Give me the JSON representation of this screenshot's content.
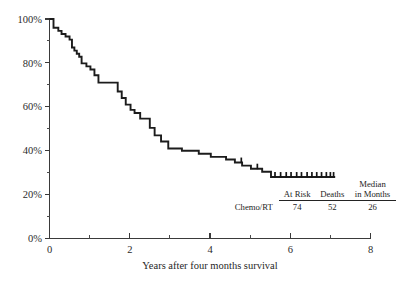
{
  "chart_data": {
    "type": "line",
    "subtype": "kaplan-meier-step",
    "title": "",
    "xlabel": "Years after four months survival",
    "ylabel": "",
    "xlim": [
      0,
      8
    ],
    "ylim": [
      0,
      100
    ],
    "grid": false,
    "legend_position": "inside-bottom-right-table",
    "x_ticks_major": [
      0,
      2,
      4,
      6,
      8
    ],
    "x_ticks_major_labels": [
      "0",
      "2",
      "4",
      "6",
      "8"
    ],
    "x_ticks_minor": [
      1,
      3,
      5,
      7
    ],
    "y_ticks_major": [
      0,
      20,
      40,
      60,
      80,
      100
    ],
    "y_ticks_major_labels": [
      "0%",
      "20%",
      "40%",
      "60%",
      "80%",
      "100%"
    ],
    "y_ticks_minor": [
      10,
      30,
      50,
      70,
      90
    ],
    "series": [
      {
        "name": "Chemo/RT",
        "x": [
          0.0,
          0.1,
          0.1,
          0.22,
          0.22,
          0.3,
          0.3,
          0.4,
          0.4,
          0.5,
          0.5,
          0.56,
          0.56,
          0.62,
          0.62,
          0.68,
          0.68,
          0.74,
          0.74,
          0.8,
          0.8,
          0.92,
          0.92,
          1.02,
          1.02,
          1.12,
          1.12,
          1.22,
          1.22,
          1.34,
          1.34,
          1.5,
          1.5,
          1.7,
          1.7,
          1.8,
          1.8,
          1.9,
          1.9,
          2.02,
          2.02,
          2.12,
          2.12,
          2.26,
          2.26,
          2.38,
          2.38,
          2.5,
          2.5,
          2.62,
          2.62,
          2.78,
          2.78,
          2.96,
          2.96,
          3.3,
          3.3,
          3.72,
          3.72,
          4.02,
          4.02,
          4.4,
          4.4,
          4.62,
          4.62,
          4.8,
          4.8,
          5.02,
          5.02,
          5.3,
          5.3,
          5.52,
          5.52,
          7.12
        ],
        "y": [
          100.0,
          100.0,
          96.0,
          96.0,
          94.6,
          94.6,
          93.2,
          93.2,
          92.0,
          92.0,
          90.6,
          90.6,
          87.0,
          87.0,
          85.6,
          85.6,
          84.2,
          84.2,
          82.8,
          82.8,
          79.8,
          79.8,
          78.4,
          78.4,
          77.0,
          77.0,
          74.4,
          74.4,
          71.0,
          71.0,
          71.0,
          71.0,
          71.0,
          71.0,
          67.0,
          67.0,
          64.0,
          64.0,
          61.0,
          61.0,
          58.6,
          58.6,
          57.2,
          57.2,
          54.6,
          54.6,
          54.6,
          54.6,
          50.4,
          50.4,
          47.0,
          47.0,
          44.2,
          44.2,
          41.0,
          41.0,
          40.0,
          40.0,
          38.6,
          38.6,
          37.2,
          37.2,
          36.0,
          36.0,
          34.6,
          34.6,
          33.2,
          33.2,
          31.8,
          31.8,
          30.4,
          30.4,
          28.0,
          28.0
        ],
        "censored_x": [
          4.78,
          5.18,
          5.62,
          5.76,
          5.9,
          6.02,
          6.16,
          6.28,
          6.42,
          6.54,
          6.66,
          6.78,
          6.9,
          7.0,
          7.08
        ],
        "censored_y": [
          34.6,
          31.8,
          28.0,
          28.0,
          28.0,
          28.0,
          28.0,
          28.0,
          28.0,
          28.0,
          28.0,
          28.0,
          28.0,
          28.0,
          28.0
        ],
        "final_survival_percent": 28,
        "color": "#1c1c1c"
      }
    ],
    "annotations": []
  },
  "summary": {
    "columns": [
      {
        "label_line1": "",
        "label_line2": ""
      },
      {
        "label_line1": "",
        "label_line2": "At Risk"
      },
      {
        "label_line1": "",
        "label_line2": "Deaths"
      },
      {
        "label_line1": "Median",
        "label_line2": "in Months"
      }
    ],
    "col_header_at_risk": "At Risk",
    "col_header_deaths": "Deaths",
    "col_header_median_line1": "Median",
    "col_header_median_line2": "in Months",
    "rows": [
      {
        "group": "Chemo/RT",
        "at_risk": "74",
        "deaths": "52",
        "median_months": "26"
      }
    ]
  },
  "axes": {
    "x_title": "Years after four months survival",
    "x_labels": [
      "0",
      "2",
      "4",
      "6",
      "8"
    ],
    "y_labels": [
      "100%",
      "80%",
      "60%",
      "40%",
      "20%",
      "0%"
    ]
  },
  "colors": {
    "curve": "#1c1c1c",
    "axis": "#3a3a3a",
    "text": "#1f1f1f",
    "background": "#ffffff"
  }
}
